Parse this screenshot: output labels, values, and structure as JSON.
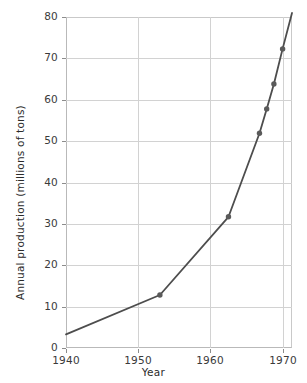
{
  "chart_data": {
    "type": "line",
    "title": "",
    "xlabel": "Year",
    "ylabel": "Annual production (millions of tons)",
    "xlim": [
      1940,
      1971.3
    ],
    "ylim": [
      0,
      80
    ],
    "xticks": [
      1940,
      1950,
      1960,
      1970
    ],
    "xticklabels": [
      "1940",
      "1950",
      "1960",
      "1970"
    ],
    "yticks": [
      0,
      10,
      20,
      30,
      40,
      50,
      60,
      70,
      80
    ],
    "yticklabels": [
      "0",
      "10",
      "20",
      "30",
      "40",
      "50",
      "60",
      "70",
      "80"
    ],
    "grid": "horizontal-and-vertical",
    "legend": "none",
    "series": [
      {
        "name": "Annual production",
        "line_color": "#4d4d4d",
        "marker_color": "#5a5a5a",
        "marker": "circle",
        "x": [
          1940,
          1953,
          1962.5,
          1966.8,
          1967.8,
          1968.8,
          1970,
          1971.3
        ],
        "y": [
          3.3,
          12.8,
          31.7,
          51.9,
          57.8,
          63.8,
          72.3,
          81.0
        ],
        "marker_visible": [
          false,
          true,
          true,
          true,
          true,
          true,
          true,
          false
        ]
      }
    ],
    "points": [
      {
        "x": 1940,
        "y": 3.3,
        "marker": false
      },
      {
        "x": 1953,
        "y": 12.8,
        "marker": true
      },
      {
        "x": 1962.5,
        "y": 31.7,
        "marker": true
      },
      {
        "x": 1966.8,
        "y": 51.9,
        "marker": true
      },
      {
        "x": 1967.8,
        "y": 57.8,
        "marker": true
      },
      {
        "x": 1968.8,
        "y": 63.8,
        "marker": true
      },
      {
        "x": 1970,
        "y": 72.3,
        "marker": true
      },
      {
        "x": 1971.3,
        "y": 81.0,
        "marker": false
      }
    ]
  },
  "colors": {
    "background": "#ffffff",
    "grid": "#d2d2d2",
    "axis": "#b9b9b9",
    "line": "#4d4d4d",
    "marker": "#5a5a5a",
    "text": "#2b2b2b"
  }
}
